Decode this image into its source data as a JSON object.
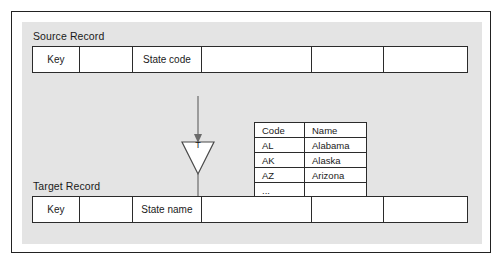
{
  "diagram": {
    "colors": {
      "frame_border": "#222222",
      "panel_background": "#e4e4e4",
      "cell_border": "#2b2b2b",
      "cell_background": "#ffffff",
      "text": "#1a1a1a",
      "connector": "#6b6b6b"
    }
  },
  "source_record": {
    "label": "Source Record",
    "cells": [
      {
        "text": "Key"
      },
      {
        "text": ""
      },
      {
        "text": "State code"
      },
      {
        "text": ""
      },
      {
        "text": ""
      },
      {
        "text": ""
      }
    ]
  },
  "target_record": {
    "label": "Target Record",
    "cells": [
      {
        "text": "Key"
      },
      {
        "text": ""
      },
      {
        "text": "State name"
      },
      {
        "text": ""
      },
      {
        "text": ""
      },
      {
        "text": ""
      }
    ]
  },
  "transform": {
    "symbol_label": "T",
    "shape": "downward-triangle"
  },
  "lookup_table": {
    "headers": [
      "Code",
      "Name"
    ],
    "rows": [
      [
        "AL",
        "Alabama"
      ],
      [
        "AK",
        "Alaska"
      ],
      [
        "AZ",
        "Arizona"
      ],
      [
        "...",
        ""
      ]
    ]
  }
}
